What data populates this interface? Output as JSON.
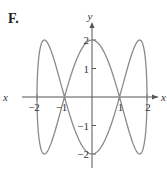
{
  "panel_label": "F.",
  "chart_data": {
    "type": "line",
    "title": "",
    "xlabel": "x",
    "ylabel": "y",
    "parametric": {
      "x": "2 sin t",
      "y": "2 cos 3t",
      "t_range": [
        0,
        6.2832
      ]
    },
    "x_ticks": [
      -2,
      -1,
      1,
      2
    ],
    "y_ticks": [
      -2,
      -1,
      1,
      2
    ],
    "x_tick_labels": [
      "−2",
      "−1",
      "1",
      "2"
    ],
    "y_tick_labels": [
      "−2",
      "−1",
      "1",
      "2"
    ],
    "xlim": [
      -2.3,
      2.3
    ],
    "ylim": [
      -2.3,
      2.3
    ],
    "grid": false,
    "key_points": [
      {
        "x": 0,
        "y": 2
      },
      {
        "x": 0,
        "y": -2
      },
      {
        "x": -1,
        "y": 0
      },
      {
        "x": 1,
        "y": 0
      },
      {
        "x": -2,
        "y": 0
      },
      {
        "x": 2,
        "y": 0
      },
      {
        "x": 1.73,
        "y": 2
      },
      {
        "x": -1.73,
        "y": 2
      },
      {
        "x": 1.73,
        "y": -2
      },
      {
        "x": -1.73,
        "y": -2
      }
    ],
    "curve_color": "#8a8a8a",
    "axis_color": "#555555"
  }
}
